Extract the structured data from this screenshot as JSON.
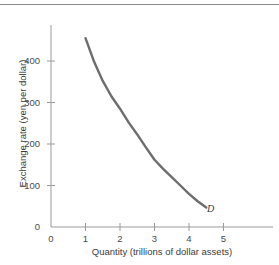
{
  "chart_data": {
    "type": "line",
    "title": "",
    "xlabel": "Quantity (trillions of dollar assets)",
    "ylabel": "Exchange rate (yen per dollar)",
    "xlim": [
      0,
      5.8
    ],
    "ylim": [
      0,
      490
    ],
    "xticks": [
      "0",
      "1",
      "2",
      "3",
      "4",
      "5"
    ],
    "xtick_values": [
      0,
      1,
      2,
      3,
      4,
      5
    ],
    "yticks": [
      "0",
      "100",
      "200",
      "300",
      "400"
    ],
    "ytick_values": [
      0,
      100,
      200,
      300,
      400
    ],
    "grid": false,
    "legend": "none",
    "series": [
      {
        "name": "D",
        "annotation": "D",
        "color": "#6d6d6d",
        "x": [
          1.0,
          1.25,
          1.5,
          1.75,
          2.0,
          2.25,
          2.5,
          2.75,
          3.0,
          3.25,
          3.5,
          3.75,
          4.0,
          4.25,
          4.5
        ],
        "values": [
          455,
          398,
          352,
          315,
          285,
          252,
          223,
          192,
          162,
          140,
          120,
          100,
          80,
          62,
          47
        ]
      }
    ]
  },
  "axis_titles": {
    "x": "Quantity (trillions of dollar assets)",
    "y": "Exchange rate (yen per dollar)"
  },
  "curve": {
    "label": "D"
  },
  "colors": {
    "curve": "#6d6d6d",
    "axis": "#9a9a9a",
    "text": "#3a3a3a",
    "rule": "#8a8a8a",
    "background": "#ffffff"
  }
}
